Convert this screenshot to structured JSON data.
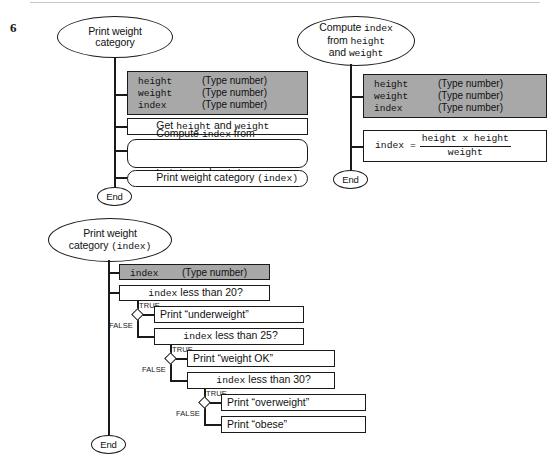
{
  "page": {
    "number": "6"
  },
  "chart1": {
    "title_line1": "Print weight",
    "title_line2": "category",
    "declarations": [
      {
        "name": "height",
        "type": "(Type number)"
      },
      {
        "name": "weight",
        "type": "(Type number)"
      },
      {
        "name": "index",
        "type": "(Type number)"
      }
    ],
    "steps": [
      {
        "sans1": "Get ",
        "mono1": "height",
        "sans2": " and ",
        "mono2": "weight"
      }
    ],
    "compute_line1_sans1": "Compute ",
    "compute_line1_mono": "index",
    "compute_line1_sans2": " from",
    "compute_line2_mono1": "height",
    "compute_line2_sans": " and ",
    "compute_line2_mono2": "weight",
    "print_sans": "Print weight category ",
    "print_mono": "(index)",
    "end_label": "End"
  },
  "chart2": {
    "title_line1_sans": "Compute ",
    "title_line1_mono": "index",
    "title_line2_sans": "from ",
    "title_line2_mono": "height",
    "title_line3_sans": "and ",
    "title_line3_mono": "weight",
    "declarations": [
      {
        "name": "height",
        "type": "(Type number)"
      },
      {
        "name": "weight",
        "type": "(Type number)"
      },
      {
        "name": "index",
        "type": "(Type number)"
      }
    ],
    "formula_lhs": "index = ",
    "formula_numerator": "height x height",
    "formula_denominator": "weight",
    "end_label": "End"
  },
  "chart3": {
    "title_line1": "Print weight",
    "title_line2_sans": "category ",
    "title_line2_mono": "(index)",
    "declaration": {
      "name": "index",
      "type": "(Type number)"
    },
    "true_label": "TRUE",
    "false_label": "FALSE",
    "conditions": [
      {
        "mono": "index",
        "sans": " less than 20?"
      },
      {
        "mono": "index",
        "sans": " less than 25?"
      },
      {
        "mono": "index",
        "sans": " less than 30?"
      }
    ],
    "outputs": [
      "Print “underweight”",
      "Print “weight OK”",
      "Print “overweight”",
      "Print “obese”"
    ],
    "end_label": "End"
  },
  "colors": {
    "stroke": "#1a1a1a",
    "declaration_fill": "#a8a8a8",
    "background": "#ffffff"
  }
}
